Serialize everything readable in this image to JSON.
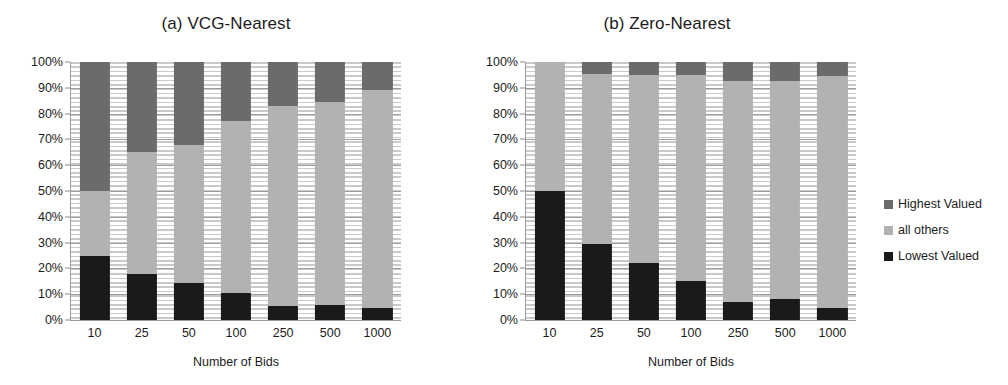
{
  "figure": {
    "xlabel": "Number of Bids",
    "y_ticks": [
      "100%",
      "90%",
      "80%",
      "70%",
      "60%",
      "50%",
      "40%",
      "30%",
      "20%",
      "10%",
      "0%"
    ]
  },
  "legend": {
    "items": [
      {
        "label": "Highest Valued",
        "color": "#6b6b6b"
      },
      {
        "label": "all others",
        "color": "#b2b2b2"
      },
      {
        "label": "Lowest Valued",
        "color": "#1a1a1a"
      }
    ]
  },
  "panels": [
    {
      "title": "(a) VCG-Nearest"
    },
    {
      "title": "(b) Zero-Nearest"
    }
  ],
  "chart_data": [
    {
      "type": "bar",
      "title": "(a) VCG-Nearest",
      "xlabel": "Number of Bids",
      "ylabel": "",
      "ylim": [
        0,
        100
      ],
      "grid": true,
      "stacked": true,
      "legend_position": "right",
      "categories": [
        "10",
        "25",
        "50",
        "100",
        "250",
        "500",
        "1000"
      ],
      "tick_labels": [
        "0%",
        "10%",
        "20%",
        "30%",
        "40%",
        "50%",
        "60%",
        "70%",
        "80%",
        "90%",
        "100%"
      ],
      "series": [
        {
          "name": "Lowest Valued",
          "color": "#1a1a1a",
          "values": [
            25,
            18,
            14.5,
            10.5,
            5.5,
            6,
            4.5
          ]
        },
        {
          "name": "all others",
          "color": "#b2b2b2",
          "values": [
            25,
            47,
            53.5,
            66.5,
            77.5,
            78.5,
            84.5
          ]
        },
        {
          "name": "Highest Valued",
          "color": "#6b6b6b",
          "values": [
            50,
            35,
            32,
            23,
            17,
            15.5,
            11
          ]
        }
      ]
    },
    {
      "type": "bar",
      "title": "(b) Zero-Nearest",
      "xlabel": "Number of Bids",
      "ylabel": "",
      "ylim": [
        0,
        100
      ],
      "grid": true,
      "stacked": true,
      "legend_position": "right",
      "categories": [
        "10",
        "25",
        "50",
        "100",
        "250",
        "500",
        "1000"
      ],
      "tick_labels": [
        "0%",
        "10%",
        "20%",
        "30%",
        "40%",
        "50%",
        "60%",
        "70%",
        "80%",
        "90%",
        "100%"
      ],
      "series": [
        {
          "name": "Lowest Valued",
          "color": "#1a1a1a",
          "values": [
            50,
            29.5,
            22,
            15,
            7,
            8,
            4.5
          ]
        },
        {
          "name": "all others",
          "color": "#b2b2b2",
          "values": [
            50,
            66,
            73,
            80,
            85.5,
            84.5,
            90
          ]
        },
        {
          "name": "Highest Valued",
          "color": "#6b6b6b",
          "values": [
            0,
            4.5,
            5,
            5,
            7.5,
            7.5,
            5.5
          ]
        }
      ]
    }
  ]
}
